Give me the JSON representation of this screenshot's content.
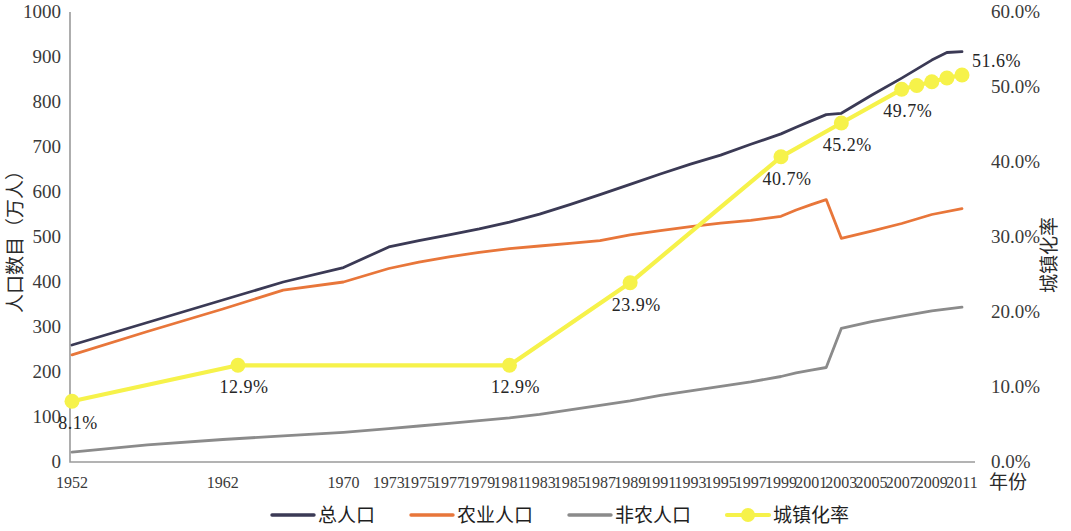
{
  "chart_data": {
    "type": "line",
    "title": "",
    "xlabel": "年份",
    "ylabel": "人口数目（万人）",
    "y2label": "城镇化率",
    "grid": false,
    "legend_position": "bottom",
    "ylim": [
      0,
      1000
    ],
    "y2lim": [
      0,
      60
    ],
    "xlim": [
      1952,
      2011
    ],
    "y_ticks": [
      "0",
      "100",
      "200",
      "300",
      "400",
      "500",
      "600",
      "700",
      "800",
      "900",
      "1000"
    ],
    "y2_ticks": [
      "0.0%",
      "10.0%",
      "20.0%",
      "30.0%",
      "40.0%",
      "50.0%",
      "60.0%"
    ],
    "x_ticks": [
      "1952",
      "1962",
      "1970",
      "1973",
      "1975",
      "1977",
      "1979",
      "1981",
      "1983",
      "1985",
      "1987",
      "1989",
      "1991",
      "1993",
      "1995",
      "1997",
      "1999",
      "2001",
      "2003",
      "2005",
      "2007",
      "2009",
      "2011"
    ],
    "series": [
      {
        "name": "总人口",
        "axis": "left",
        "color": "#3b3a55",
        "x": [
          1952,
          1957,
          1962,
          1966,
          1970,
          1973,
          1975,
          1977,
          1979,
          1981,
          1983,
          1985,
          1987,
          1989,
          1991,
          1993,
          1995,
          1997,
          1999,
          2000,
          2001,
          2002,
          2003,
          2005,
          2007,
          2009,
          2010,
          2011
        ],
        "values": [
          260,
          310,
          360,
          400,
          432,
          478,
          492,
          505,
          518,
          533,
          551,
          572,
          594,
          617,
          640,
          662,
          682,
          706,
          729,
          744,
          758,
          772,
          775,
          815,
          853,
          893,
          910,
          912
        ]
      },
      {
        "name": "农业人口",
        "axis": "left",
        "color": "#e8763a",
        "x": [
          1952,
          1957,
          1962,
          1966,
          1970,
          1973,
          1975,
          1977,
          1979,
          1981,
          1983,
          1985,
          1987,
          1989,
          1991,
          1993,
          1995,
          1997,
          1999,
          2000,
          2001,
          2002,
          2003,
          2005,
          2007,
          2009,
          2011
        ],
        "values": [
          238,
          290,
          340,
          382,
          400,
          430,
          444,
          456,
          466,
          474,
          480,
          486,
          492,
          505,
          514,
          523,
          531,
          537,
          546,
          560,
          572,
          583,
          497,
          513,
          530,
          550,
          563
        ]
      },
      {
        "name": "非农人口",
        "axis": "left",
        "color": "#8b8b8b",
        "x": [
          1952,
          1957,
          1962,
          1966,
          1970,
          1973,
          1975,
          1977,
          1979,
          1981,
          1983,
          1985,
          1987,
          1989,
          1991,
          1993,
          1995,
          1997,
          1999,
          2000,
          2001,
          2002,
          2003,
          2005,
          2007,
          2009,
          2011
        ],
        "values": [
          22,
          38,
          50,
          58,
          66,
          74,
          80,
          86,
          92,
          98,
          106,
          116,
          126,
          136,
          148,
          158,
          168,
          178,
          190,
          198,
          204,
          210,
          297,
          312,
          324,
          336,
          344
        ]
      },
      {
        "name": "城镇化率",
        "axis": "right",
        "color": "#f6f24a",
        "x": [
          1952,
          1963,
          1981,
          1989,
          1999,
          2003,
          2007,
          2008,
          2009,
          2010,
          2011
        ],
        "values": [
          8.1,
          12.9,
          12.9,
          23.9,
          40.7,
          45.2,
          49.7,
          50.2,
          50.7,
          51.2,
          51.6
        ],
        "labels": [
          "8.1%",
          "12.9%",
          "12.9%",
          "23.9%",
          "40.7%",
          "45.2%",
          "49.7%",
          "",
          "",
          "",
          "51.6%"
        ]
      }
    ]
  },
  "legend": {
    "items": [
      {
        "label": "总人口",
        "color": "#3b3a55",
        "marker": "none"
      },
      {
        "label": "农业人口",
        "color": "#e8763a",
        "marker": "none"
      },
      {
        "label": "非农人口",
        "color": "#8b8b8b",
        "marker": "none"
      },
      {
        "label": "城镇化率",
        "color": "#f6f24a",
        "marker": "circle"
      }
    ]
  }
}
